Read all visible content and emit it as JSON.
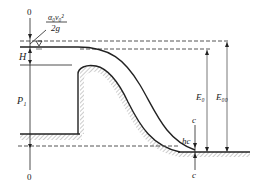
{
  "diagram": {
    "type": "spillway-weir-hydraulics",
    "labels": {
      "section_top": "0",
      "section_bottom": "0",
      "velocity_head_num": "α₀v₀²",
      "velocity_head_den": "2g",
      "head": "H",
      "weir_height": "P₁",
      "energy_total": "E₀",
      "energy_section": "E₀₀",
      "contracted_depth": "hc",
      "section_c_top": "c",
      "section_c_bottom": "c"
    },
    "colors": {
      "line": "#222222",
      "hatch": "#999999",
      "dashed": "#555555"
    }
  }
}
